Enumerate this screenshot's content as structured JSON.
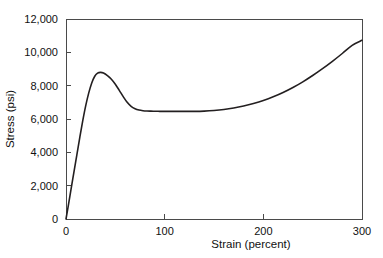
{
  "chart_data": {
    "type": "line",
    "title": "",
    "xlabel": "Strain (percent)",
    "ylabel": "Stress (psi)",
    "xlim": [
      0,
      300
    ],
    "ylim": [
      0,
      12000
    ],
    "grid": false,
    "legend": null,
    "x_ticks": [
      "0",
      "100",
      "200",
      "300"
    ],
    "x_tick_values": [
      0,
      100,
      200,
      300
    ],
    "y_ticks": [
      "0",
      "2,000",
      "4,000",
      "6,000",
      "8,000",
      "10,000",
      "12,000"
    ],
    "y_tick_values": [
      0,
      2000,
      4000,
      6000,
      8000,
      10000,
      12000
    ],
    "series": [
      {
        "name": "stress-strain",
        "color": "#231f20",
        "x": [
          0,
          2,
          5,
          8,
          11,
          14,
          17,
          20,
          23,
          26,
          29,
          32,
          35,
          38,
          42,
          46,
          50,
          54,
          58,
          62,
          66,
          70,
          74,
          78,
          82,
          86,
          90,
          95,
          100,
          110,
          120,
          130,
          140,
          150,
          160,
          170,
          180,
          190,
          200,
          210,
          220,
          230,
          240,
          250,
          260,
          270,
          280,
          290,
          300
        ],
        "y": [
          0,
          680,
          1750,
          2800,
          3850,
          4900,
          5900,
          6800,
          7550,
          8150,
          8550,
          8750,
          8800,
          8760,
          8600,
          8380,
          8080,
          7720,
          7340,
          7000,
          6760,
          6620,
          6540,
          6500,
          6480,
          6470,
          6465,
          6460,
          6458,
          6455,
          6455,
          6460,
          6475,
          6510,
          6570,
          6660,
          6780,
          6930,
          7110,
          7330,
          7590,
          7890,
          8230,
          8610,
          9020,
          9460,
          9930,
          10420,
          10720
        ]
      }
    ],
    "annotations": {
      "yield_peak": {
        "x": 35,
        "y": 8800
      },
      "plateau": {
        "x_range": [
          85,
          150
        ],
        "y": 6460
      },
      "end_point": {
        "x": 300,
        "y": 10720
      }
    }
  }
}
